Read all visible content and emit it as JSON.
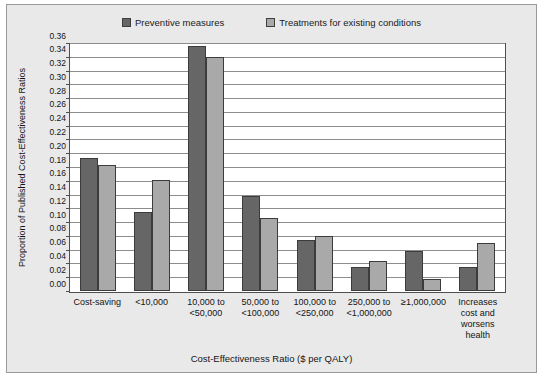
{
  "chart_data": {
    "type": "bar",
    "title": "",
    "xlabel": "Cost-Effectiveness Ratio ($ per QALY)",
    "ylabel": "Proportion of Published Cost-Effectiveness Ratios",
    "ylim": [
      0.0,
      0.36
    ],
    "ytick_step": 0.02,
    "grid": true,
    "legend_position": "top-center",
    "categories": [
      "Cost-saving",
      "<10,000",
      "10,000 to\n<50,000",
      "50,000 to\n<100,000",
      "100,000 to\n<250,000",
      "250,000 to\n<1,000,000",
      "≥1,000,000",
      "Increases\ncost and\nworsens\nhealth"
    ],
    "ytick_labels": [
      "0.00",
      "0.02",
      "0.04",
      "0.06",
      "0.08",
      "0.10",
      "0.12",
      "0.14",
      "0.16",
      "0.18",
      "0.20",
      "0.22",
      "0.24",
      "0.26",
      "0.28",
      "0.30",
      "0.32",
      "0.34",
      "0.36"
    ],
    "ytick_values": [
      0.0,
      0.02,
      0.04,
      0.06,
      0.08,
      0.1,
      0.12,
      0.14,
      0.16,
      0.18,
      0.2,
      0.22,
      0.24,
      0.26,
      0.28,
      0.3,
      0.32,
      0.34,
      0.36
    ],
    "series": [
      {
        "name": "Preventive measures",
        "color": "#666666",
        "values": [
          0.195,
          0.116,
          0.358,
          0.139,
          0.074,
          0.035,
          0.059,
          0.035
        ]
      },
      {
        "name": "Treatments for existing conditions",
        "color": "#a9a9a9",
        "values": [
          0.185,
          0.163,
          0.343,
          0.107,
          0.081,
          0.044,
          0.018,
          0.07
        ]
      }
    ]
  }
}
